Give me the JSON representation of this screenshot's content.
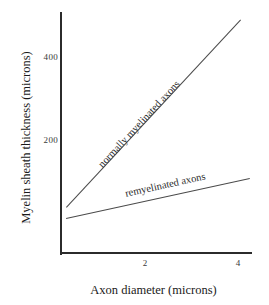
{
  "chart_data": {
    "type": "line",
    "title": "",
    "xlabel": "Axon diameter (microns)",
    "ylabel": "Myelin sheath thickness (microns)",
    "xlim": [
      0,
      4.6
    ],
    "ylim": [
      0,
      580
    ],
    "xticks": [
      "2",
      "4"
    ],
    "xtick_values": [
      2,
      4
    ],
    "yticks": [
      "200",
      "400"
    ],
    "ytick_values": [
      200,
      400
    ],
    "grid": false,
    "legend_position": "inline-along-lines",
    "series": [
      {
        "name": "normally myelinated axons",
        "x": [
          0.3,
          4.05
        ],
        "values": [
          40,
          545
        ]
      },
      {
        "name": "remyelinated axons",
        "x": [
          0.3,
          4.3
        ],
        "values": [
          15,
          112
        ]
      }
    ]
  },
  "axes": {
    "y_title": "Myelin sheath thickness (microns)",
    "x_title": "Axon diameter (microns)",
    "y_tick_400": "400",
    "y_tick_200": "200",
    "x_tick_2": "2",
    "x_tick_4": "4"
  },
  "series_labels": {
    "normal": "normally myelinated axons",
    "remyelinated": "remyelinated axons"
  },
  "colors": {
    "background": "#ffffff",
    "axis": "#2b2b2b",
    "line": "#4a4a4a",
    "text": "#1a1a1a"
  }
}
